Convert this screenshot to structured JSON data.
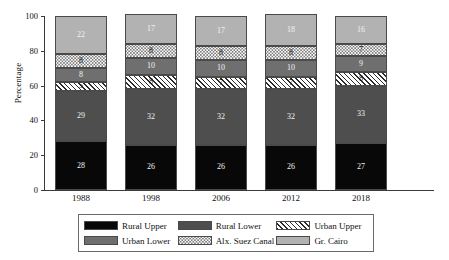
{
  "chart_data": {
    "type": "bar",
    "variant": "stacked-vertical-100",
    "title": "",
    "xlabel": "",
    "ylabel": "Percentage",
    "ylim": [
      0,
      100
    ],
    "yticks": [
      0,
      20,
      40,
      60,
      80,
      100
    ],
    "grid": false,
    "legend_position": "bottom",
    "categories": [
      "1988",
      "1998",
      "2006",
      "2012",
      "2018"
    ],
    "series": [
      {
        "name": "Rural Upper",
        "color": "#080808",
        "pattern": "solid",
        "values": [
          28,
          26,
          26,
          26,
          27
        ]
      },
      {
        "name": "Rural Lower",
        "color": "#4e4e4e",
        "pattern": "solid",
        "values": [
          29,
          32,
          32,
          32,
          33
        ]
      },
      {
        "name": "Urban Upper",
        "color": "#ffffff",
        "pattern": "diagonal",
        "values": [
          5,
          8,
          7,
          7,
          8
        ]
      },
      {
        "name": "Urban Lower",
        "color": "#6f6f6f",
        "pattern": "solid",
        "values": [
          8,
          10,
          10,
          10,
          9
        ]
      },
      {
        "name": "Alx. Suez Canal",
        "color": "#ffffff",
        "pattern": "dotted",
        "values": [
          8,
          8,
          8,
          8,
          7
        ]
      },
      {
        "name": "Gr. Cairo",
        "color": "#b2b2b2",
        "pattern": "solid",
        "values": [
          22,
          17,
          17,
          18,
          16
        ]
      }
    ]
  },
  "axis": {
    "ylabel": "Percentage",
    "yticks": [
      "0",
      "20",
      "40",
      "60",
      "80",
      "100"
    ],
    "xticks": [
      "1988",
      "1998",
      "2006",
      "2012",
      "2018"
    ]
  },
  "legend": {
    "items": [
      {
        "label": "Rural Upper",
        "key": "rural-upper"
      },
      {
        "label": "Rural Lower",
        "key": "rural-lower"
      },
      {
        "label": "Urban Upper",
        "key": "urban-upper"
      },
      {
        "label": "Urban Lower",
        "key": "urban-lower"
      },
      {
        "label": "Alx. Suez Canal",
        "key": "alx-suez"
      },
      {
        "label": "Gr. Cairo",
        "key": "gr-cairo"
      }
    ]
  }
}
